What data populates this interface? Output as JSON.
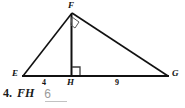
{
  "figure": {
    "name": "right-triangle-with-altitude",
    "stroke_color": "#111111",
    "vertices": {
      "F": {
        "label": "F",
        "x": 72,
        "y": 13
      },
      "E": {
        "label": "E",
        "x": 23,
        "y": 76
      },
      "H": {
        "label": "H",
        "x": 71,
        "y": 76
      },
      "G": {
        "label": "G",
        "x": 168,
        "y": 76
      }
    },
    "segment_labels": {
      "EH": "4",
      "HG": "9"
    },
    "right_angle_marks": [
      {
        "at": "F",
        "name": "right-angle-mark-f"
      },
      {
        "at": "H",
        "name": "right-angle-mark-h"
      }
    ]
  },
  "problem": {
    "number": "4.",
    "segment": "FH",
    "answer": "6",
    "answer_color": "#9a9a9a"
  }
}
